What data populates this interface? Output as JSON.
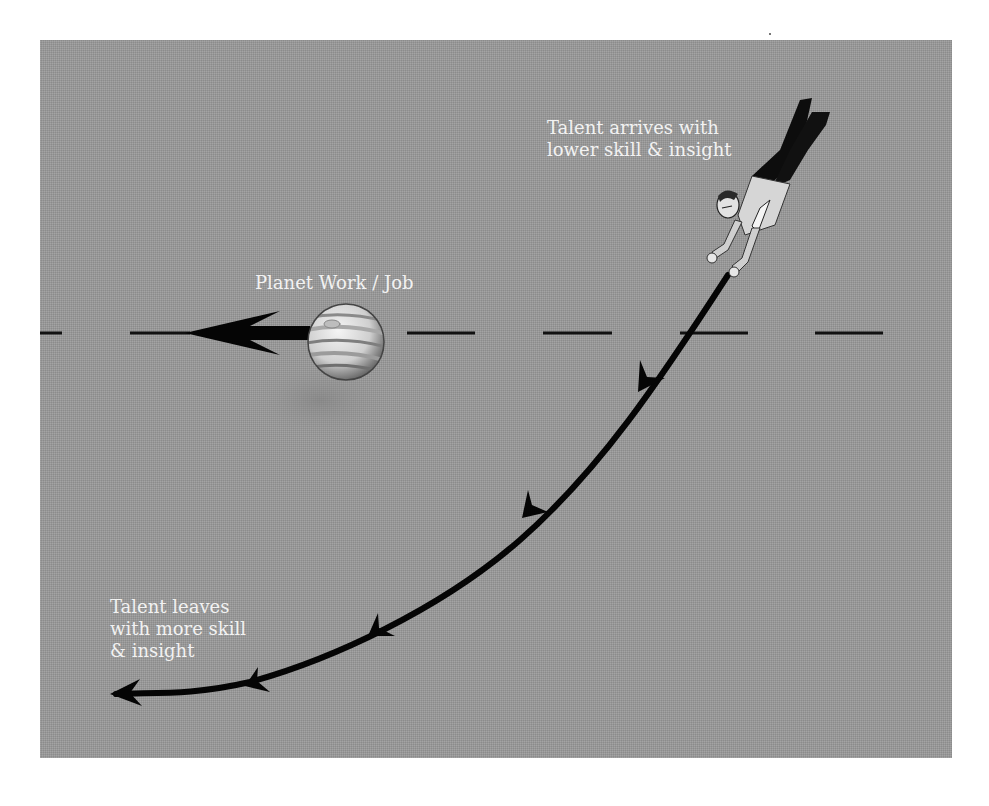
{
  "diagram": {
    "background_color": "#9a9a9a",
    "text_color": "#f2f2f2",
    "line_color": "#0a0a0a",
    "labels": {
      "planet": "Planet Work / Job",
      "arrives_line1": "Talent arrives with",
      "arrives_line2": "lower skill & insight",
      "leaves_line1": "Talent leaves",
      "leaves_line2": "with more skill",
      "leaves_line3": "& insight"
    },
    "elements": {
      "planet": "jupiter-like striped planet with motion arrow pointing left",
      "figure": "falling businessman figure, head down",
      "trajectory": "curved arrow path from figure sweeping down-left, 4 arrowheads",
      "orbit_line": "horizontal dashed line through planet"
    }
  }
}
